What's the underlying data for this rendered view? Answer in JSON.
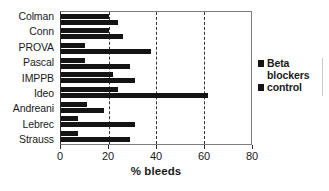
{
  "chart_data": {
    "type": "bar",
    "orientation": "horizontal",
    "title": "",
    "xlabel": "% bleeds",
    "ylabel": "",
    "xlim": [
      0,
      80
    ],
    "xticks": [
      0,
      20,
      40,
      60,
      80
    ],
    "gridlines": [
      20,
      40,
      60
    ],
    "grid": true,
    "legend_position": "right",
    "categories": [
      "Colman",
      "Conn",
      "PROVA",
      "Pascal",
      "IMPPB",
      "Ideo",
      "Andreani",
      "Lebrec",
      "Strauss"
    ],
    "series": [
      {
        "name": "Beta blockers",
        "color": "#141414",
        "values": [
          20,
          20,
          10,
          10,
          22,
          24,
          11,
          7,
          7
        ]
      },
      {
        "name": "control",
        "color": "#141414",
        "values": [
          24,
          26,
          38,
          29,
          31,
          62,
          18,
          31,
          29
        ]
      }
    ]
  },
  "legend": {
    "items": [
      {
        "label": "Beta blockers"
      },
      {
        "label": "control"
      }
    ]
  },
  "axis": {
    "x_title": "% bleeds",
    "tick_labels": [
      "0",
      "20",
      "40",
      "60",
      "80"
    ]
  }
}
